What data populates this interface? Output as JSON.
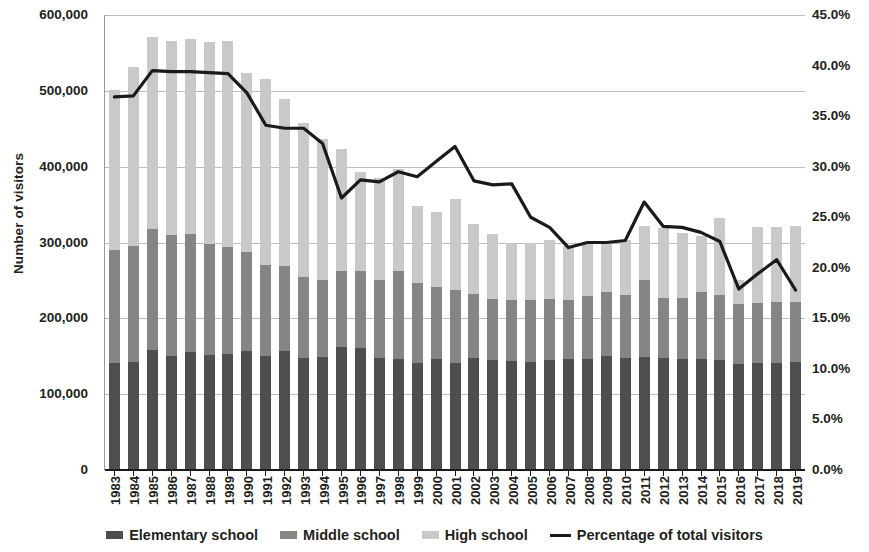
{
  "chart_data": {
    "type": "bar",
    "title": "",
    "subtitle": "",
    "xlabel": "",
    "ylabel": "Number of visitors",
    "ylabel_secondary": "",
    "grid": true,
    "legend_position": "bottom",
    "ylim": [
      0,
      600000
    ],
    "ylim_secondary": [
      0,
      0.45
    ],
    "ytick_labels": [
      "600,000",
      "500,000",
      "400,000",
      "300,000",
      "200,000",
      "100,000",
      "0"
    ],
    "ytick_values": [
      600000,
      500000,
      400000,
      300000,
      200000,
      100000,
      0
    ],
    "ytick_labels_secondary": [
      "45.0%",
      "40.0%",
      "35.0%",
      "30.0%",
      "25.0%",
      "20.0%",
      "15.0%",
      "10.0%",
      "5.0%",
      "0.0%"
    ],
    "ytick_values_secondary": [
      45.0,
      40.0,
      35.0,
      30.0,
      25.0,
      20.0,
      15.0,
      10.0,
      5.0,
      0.0
    ],
    "categories": [
      "1983",
      "1984",
      "1985",
      "1986",
      "1987",
      "1988",
      "1989",
      "1990",
      "1991",
      "1992",
      "1993",
      "1994",
      "1995",
      "1996",
      "1997",
      "1998",
      "1999",
      "2000",
      "2001",
      "2002",
      "2003",
      "2004",
      "2005",
      "2006",
      "2007",
      "2008",
      "2009",
      "2010",
      "2011",
      "2012",
      "2013",
      "2014",
      "2015",
      "2016",
      "2017",
      "2018",
      "2019"
    ],
    "stacked": true,
    "series": [
      {
        "name": "Elementary school",
        "color": "#4e4e4e",
        "values": [
          141000,
          143000,
          158000,
          150000,
          155000,
          152000,
          153000,
          157000,
          150000,
          157000,
          148000,
          149000,
          162000,
          161000,
          148000,
          147000,
          141000,
          147000,
          141000,
          148000,
          145000,
          144000,
          143000,
          145000,
          146000,
          147000,
          150000,
          148000,
          149000,
          148000,
          147000,
          147000,
          145000,
          140000,
          141000,
          141000,
          143000
        ]
      },
      {
        "name": "Middle school",
        "color": "#858585",
        "values": [
          149000,
          152000,
          160000,
          160000,
          156000,
          146000,
          141000,
          131000,
          120000,
          112000,
          107000,
          101000,
          100000,
          101000,
          102000,
          116000,
          105000,
          95000,
          97000,
          84000,
          80000,
          80000,
          81000,
          81000,
          78000,
          82000,
          85000,
          83000,
          101000,
          79000,
          80000,
          88000,
          86000,
          79000,
          79000,
          81000,
          78000
        ]
      },
      {
        "name": "High school",
        "color": "#c9c9c9",
        "values": [
          211000,
          236000,
          253000,
          256000,
          257000,
          267000,
          272000,
          236000,
          245000,
          220000,
          202000,
          187000,
          161000,
          131000,
          135000,
          134000,
          102000,
          98000,
          120000,
          92000,
          86000,
          76000,
          76000,
          77000,
          72000,
          71000,
          65000,
          73000,
          72000,
          92000,
          86000,
          73000,
          102000,
          32000,
          100000,
          98000,
          101000
        ]
      }
    ],
    "line_series": {
      "name": "Percentage of total visitors",
      "color": "#1a1a1a",
      "axis": "secondary",
      "values": [
        36.9,
        37.0,
        39.5,
        39.4,
        39.4,
        39.3,
        39.2,
        37.3,
        34.1,
        33.8,
        33.8,
        32.3,
        26.9,
        28.7,
        28.5,
        29.5,
        29.0,
        30.5,
        32.0,
        28.6,
        28.2,
        28.3,
        25.0,
        24.0,
        22.0,
        22.5,
        22.5,
        22.7,
        26.5,
        24.1,
        24.0,
        23.5,
        22.6,
        17.9,
        19.4,
        20.8,
        17.8
      ]
    }
  },
  "legend": {
    "items": [
      {
        "label": "Elementary school",
        "type": "swatch",
        "color": "#4e4e4e",
        "icon": "square-swatch-icon"
      },
      {
        "label": "Middle school",
        "type": "swatch",
        "color": "#858585",
        "icon": "square-swatch-icon"
      },
      {
        "label": "High school",
        "type": "swatch",
        "color": "#c9c9c9",
        "icon": "square-swatch-icon"
      },
      {
        "label": "Percentage of total visitors",
        "type": "line",
        "color": "#1a1a1a",
        "icon": "line-swatch-icon"
      }
    ]
  }
}
